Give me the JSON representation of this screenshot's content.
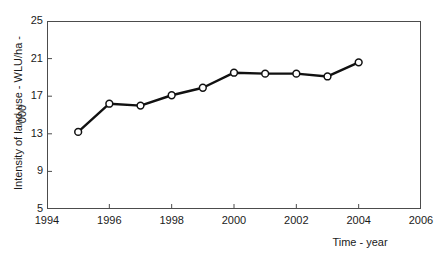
{
  "chart_data": {
    "type": "line",
    "title": "",
    "xlabel": "Time - year",
    "ylabel": "Intensity of land use - WLU/ha -",
    "ylabel_unit": "000",
    "x": [
      1995,
      1996,
      1997,
      1998,
      1999,
      2000,
      2001,
      2002,
      2003,
      2004
    ],
    "values": [
      13.2,
      16.2,
      16.0,
      17.1,
      17.9,
      19.5,
      19.4,
      19.4,
      19.1,
      20.6
    ],
    "series": [
      {
        "name": "Intensity of land use",
        "values": [
          13.2,
          16.2,
          16.0,
          17.1,
          17.9,
          19.5,
          19.4,
          19.4,
          19.1,
          20.6
        ]
      }
    ],
    "xlim": [
      1994,
      2006
    ],
    "ylim": [
      5,
      25
    ],
    "xticks": [
      1994,
      1996,
      1998,
      2000,
      2002,
      2004,
      2006
    ],
    "xtick_labels": [
      "1994",
      "1996",
      "1998",
      "2000",
      "2002",
      "2004",
      "2006"
    ],
    "yticks": [
      5,
      9,
      13,
      17,
      21,
      25
    ],
    "ytick_labels": [
      "5",
      "9",
      "13",
      "17",
      "21",
      "25"
    ],
    "grid": false,
    "legend": "none",
    "marker": "open-circle",
    "line_color": "#111111",
    "marker_fill": "#ffffff",
    "marker_edge": "#111111",
    "frame_color": "#4c4c4c"
  }
}
